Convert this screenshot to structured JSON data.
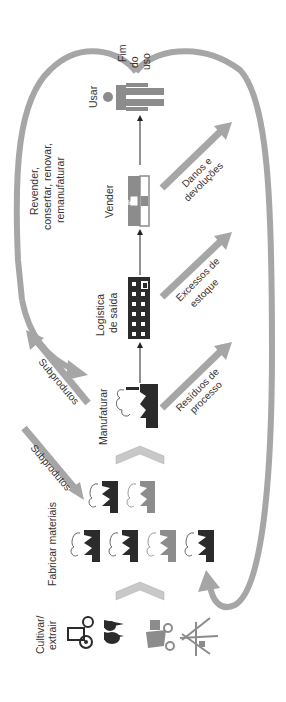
{
  "diagram": {
    "orientation": "rotated-90-ccw",
    "colors": {
      "flow_gray": "#a6a6a6",
      "dark_icon": "#2b2b2b",
      "mid_icon": "#8c8c8c",
      "light_chevron": "#c8c8c8",
      "text": "#333333"
    },
    "stages": {
      "cultivar": [
        "Cultivar/",
        "extrair"
      ],
      "fabricar": "Fabricar materiais",
      "manufaturar": "Manufaturar",
      "logistica": [
        "Logística",
        "de saída"
      ],
      "vender": "Vender",
      "usar": "Usar",
      "fim": [
        "Fim",
        "do",
        "uso"
      ]
    },
    "flows": {
      "subprodutos_1": "Subprodutos",
      "subprodutos_2": "Subprodutos",
      "residuos": [
        "Resíduos de",
        "processo"
      ],
      "excessos": [
        "Excessos de",
        "estoque"
      ],
      "danos": [
        "Danos e",
        "devoluções"
      ],
      "revender": [
        "Revender,",
        "consertar, renovar,",
        "remanufaturar"
      ]
    },
    "store_symbol": "$"
  }
}
